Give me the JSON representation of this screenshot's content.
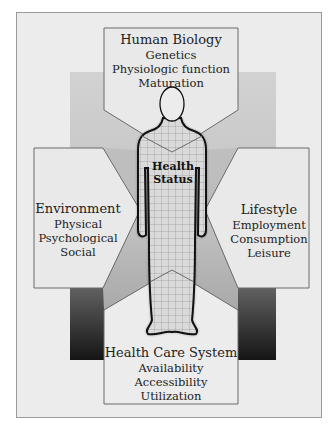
{
  "diagram": {
    "center": {
      "line1": "Health",
      "line2": "Status"
    },
    "top": {
      "title": "Human Biology",
      "items": [
        "Genetics",
        "Physiologic function",
        "Maturation"
      ]
    },
    "left": {
      "title": "Environment",
      "items": [
        "Physical",
        "Psychological",
        "Social"
      ]
    },
    "right": {
      "title": "Lifestyle",
      "items": [
        "Employment",
        "Consumption",
        "Leisure"
      ]
    },
    "bottom": {
      "title": "Health Care System",
      "items": [
        "Availability",
        "Accessibility",
        "Utilization"
      ]
    },
    "colors": {
      "background": "#ececec",
      "box_fill": "#e8e8e8",
      "box_stroke": "#6a6a6a",
      "gradient_top": "#cfcfcf",
      "gradient_bottom": "#1a1a1a",
      "figure_fill": "#dcdcdc",
      "figure_outline": "#111111"
    }
  }
}
